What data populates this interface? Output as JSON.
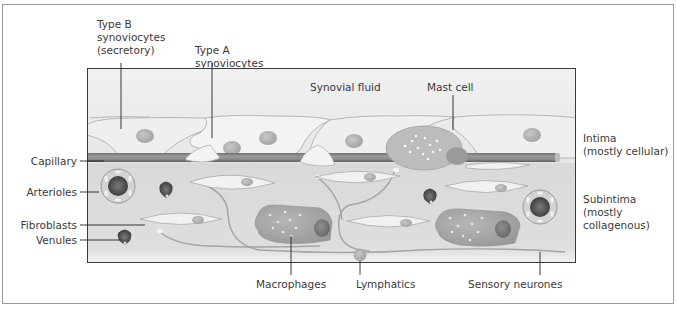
{
  "figure": {
    "colors": {
      "fluid_bg": "#ededed",
      "subintima_bg": "#dcdcdc",
      "cell_fill": "#efefef",
      "nucleus": "#b5b5b5",
      "macrophage": "#a9a9a9",
      "capillary": "#8c8c8c",
      "vessel_dark": "#4a4a4a",
      "leader_line": "#222222",
      "text": "#3a3a3a"
    }
  },
  "labels": {
    "type_b": "Type B\nsynoviocytes\n(secretory)",
    "type_a": "Type A\nsynoviocytes",
    "synovial_fluid": "Synovial fluid",
    "mast_cell": "Mast cell",
    "capillary": "Capillary",
    "arterioles": "Arterioles",
    "fibroblasts": "Fibroblasts",
    "venules": "Venules",
    "macrophages": "Macrophages",
    "lymphatics": "Lymphatics",
    "sensory_neurones": "Sensory neurones",
    "intima": "Intima\n(mostly cellular)",
    "subintima": "Subintima\n(mostly\ncollagenous)"
  }
}
